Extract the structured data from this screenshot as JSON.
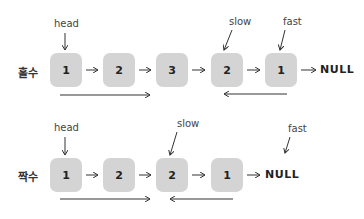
{
  "odd_case": {
    "label": "홀수",
    "nodes": [
      "1",
      "2",
      "3",
      "2",
      "1"
    ],
    "terminal": "NULL",
    "pointers": {
      "head": "head",
      "slow": "slow",
      "fast": "fast"
    }
  },
  "even_case": {
    "label": "짝수",
    "nodes": [
      "1",
      "2",
      "2",
      "1"
    ],
    "terminal": "NULL",
    "pointers": {
      "head": "head",
      "slow": "slow",
      "fast": "fast"
    }
  },
  "colors": {
    "node_fill": "#d4d4d4",
    "ink": "#2a2a2a"
  }
}
